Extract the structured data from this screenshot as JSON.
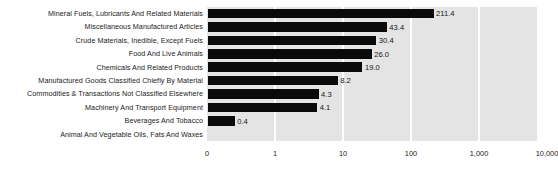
{
  "chart_data": {
    "type": "bar",
    "orientation": "horizontal",
    "title": "",
    "xlabel": "",
    "ylabel": "",
    "xscale": "log",
    "grid": true,
    "legend": false,
    "categories": [
      "Mineral Fuels, Lubricants And Related Materials",
      "Miscellaneous Manufactured Articles",
      "Crude Materials, Inedible, Except Fuels",
      "Food And Live Animals",
      "Chemicals And Related Products",
      "Manufactured Goods Classified Chiefly By Material",
      "Commodities & Transactions Not Classified Elsewhere",
      "Machinery And Transport Equipment",
      "Beverages And Tobacco",
      "Animal And Vegetable Oils, Fats And Waxes"
    ],
    "values": [
      211.4,
      43.4,
      30.4,
      26.0,
      19.0,
      8.2,
      4.3,
      4.1,
      0.4,
      null
    ],
    "value_labels": [
      "211.4",
      "43.4",
      "30.4",
      "26.0",
      "19.0",
      "8.2",
      "4.3",
      "4.1",
      "0.4",
      ""
    ],
    "xticks": [
      0,
      1,
      10,
      100,
      1000,
      10000
    ],
    "xtick_labels": [
      "0",
      "1",
      "10",
      "100",
      "1,000",
      "10,000"
    ],
    "xlim": [
      0,
      10000
    ],
    "colors": {
      "bar": "#0a0a0a",
      "plot_background": "#e4e4e4",
      "gridline": "#ffffff",
      "figure_background": "#ffffff",
      "text": "#1b1b1b"
    }
  }
}
